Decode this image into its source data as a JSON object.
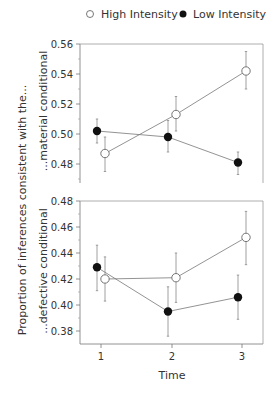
{
  "chart_data": [
    {
      "type": "line",
      "panel": "top",
      "panel_label": "...material conditional",
      "x": [
        1,
        2,
        3
      ],
      "ylim": [
        0.465,
        0.56
      ],
      "yticks": [
        "0.56",
        "0.54",
        "0.52",
        "0.50",
        "0.48"
      ],
      "series": [
        {
          "name": "High Intensity",
          "marker": "open-circle",
          "values": [
            0.487,
            0.513,
            0.542
          ],
          "err_low": [
            0.475,
            0.502,
            0.53
          ],
          "err_high": [
            0.498,
            0.525,
            0.555
          ]
        },
        {
          "name": "Low Intensity",
          "marker": "filled-circle",
          "values": [
            0.502,
            0.498,
            0.481
          ],
          "err_low": [
            0.494,
            0.488,
            0.473
          ],
          "err_high": [
            0.51,
            0.509,
            0.488
          ]
        }
      ]
    },
    {
      "type": "line",
      "panel": "bottom",
      "panel_label": "...defective conditional",
      "x": [
        1,
        2,
        3
      ],
      "ylim": [
        0.37,
        0.48
      ],
      "yticks": [
        "0.48",
        "0.46",
        "0.44",
        "0.42",
        "0.40",
        "0.38"
      ],
      "series": [
        {
          "name": "High Intensity",
          "marker": "open-circle",
          "values": [
            0.42,
            0.421,
            0.452
          ],
          "err_low": [
            0.403,
            0.402,
            0.431
          ],
          "err_high": [
            0.437,
            0.44,
            0.472
          ]
        },
        {
          "name": "Low Intensity",
          "marker": "filled-circle",
          "values": [
            0.429,
            0.395,
            0.406
          ],
          "err_low": [
            0.411,
            0.376,
            0.389
          ],
          "err_high": [
            0.446,
            0.414,
            0.423
          ]
        }
      ]
    }
  ],
  "legend": {
    "items": [
      "High Intensity",
      "Low Intensity"
    ],
    "position": "top"
  },
  "xlabel": "Time",
  "xticks": [
    "1",
    "2",
    "3"
  ],
  "ylabel": "Proportion of inferences consistent with the...",
  "top_panel_label": "...material conditional",
  "bottom_panel_label": "...defective conditional"
}
